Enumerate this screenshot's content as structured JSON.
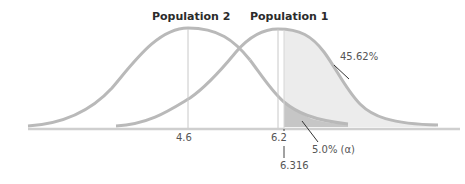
{
  "diagram": {
    "type": "overlapping-normal-distributions",
    "populations": [
      {
        "name": "Population 2",
        "mean_label": "4.6"
      },
      {
        "name": "Population 1",
        "mean_label": "6.2"
      }
    ],
    "critical_value_label": "6.316",
    "annotations": {
      "power_area": "45.62%",
      "alpha_area": "5.0% (α)"
    },
    "colors": {
      "curve": "#b9b9b9",
      "axis": "#cfcfcf",
      "power_fill": "#ececec",
      "alpha_fill": "#c6c6c6",
      "text": "#555555",
      "title": "#2b2b2b"
    }
  }
}
